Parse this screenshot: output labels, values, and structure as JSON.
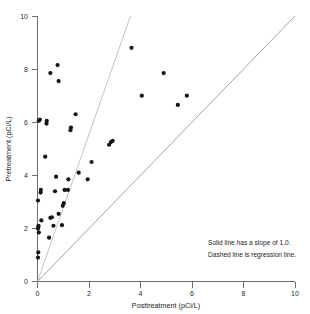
{
  "chart_data": {
    "type": "scatter",
    "title": "",
    "xlabel": "Posttreatment (pCi/L)",
    "ylabel": "Pretreatment (pCi/L)",
    "xlim": [
      0,
      10
    ],
    "ylim": [
      0,
      10
    ],
    "xticks": [
      0,
      2,
      4,
      6,
      8,
      10
    ],
    "yticks": [
      0,
      2,
      4,
      6,
      8,
      10
    ],
    "xticklabels": [
      "0",
      "2",
      "4",
      "6",
      "8",
      "10"
    ],
    "yticklabels": [
      "0",
      "2",
      "4",
      "6",
      "8",
      "10"
    ],
    "grid": false,
    "legend": "none",
    "points": [
      [
        0.02,
        0.9
      ],
      [
        0.03,
        1.1
      ],
      [
        0.05,
        1.85
      ],
      [
        0.02,
        2.0
      ],
      [
        0.03,
        2.05
      ],
      [
        0.04,
        2.1
      ],
      [
        0.15,
        2.3
      ],
      [
        0.02,
        3.05
      ],
      [
        0.12,
        3.35
      ],
      [
        0.13,
        3.45
      ],
      [
        0.05,
        6.05
      ],
      [
        0.09,
        6.1
      ],
      [
        0.35,
        5.95
      ],
      [
        0.36,
        6.05
      ],
      [
        0.3,
        4.7
      ],
      [
        0.45,
        1.65
      ],
      [
        0.5,
        2.4
      ],
      [
        0.56,
        2.42
      ],
      [
        0.62,
        2.1
      ],
      [
        0.68,
        3.4
      ],
      [
        0.72,
        3.95
      ],
      [
        0.5,
        7.85
      ],
      [
        0.78,
        8.15
      ],
      [
        0.82,
        7.55
      ],
      [
        0.82,
        2.55
      ],
      [
        0.95,
        2.12
      ],
      [
        0.98,
        2.85
      ],
      [
        1.02,
        2.95
      ],
      [
        1.05,
        3.45
      ],
      [
        1.18,
        3.45
      ],
      [
        1.2,
        3.85
      ],
      [
        1.28,
        5.7
      ],
      [
        1.3,
        5.8
      ],
      [
        1.48,
        6.3
      ],
      [
        1.6,
        4.1
      ],
      [
        1.95,
        3.85
      ],
      [
        2.1,
        4.5
      ],
      [
        2.78,
        5.15
      ],
      [
        2.85,
        5.25
      ],
      [
        2.92,
        5.3
      ],
      [
        3.65,
        8.8
      ],
      [
        4.05,
        7.0
      ],
      [
        4.9,
        7.85
      ],
      [
        5.45,
        6.65
      ],
      [
        5.8,
        7.0
      ]
    ],
    "lines": [
      {
        "name": "solid-identity-line",
        "style": "solid",
        "slope": 1.0,
        "intercept": 0.0,
        "from": [
          0,
          0
        ],
        "to": [
          10,
          10
        ]
      },
      {
        "name": "dashed-regression-line",
        "style": "dashed",
        "slope": 2.77,
        "intercept": 0.0,
        "from": [
          0,
          0
        ],
        "to": [
          3.61,
          10
        ]
      }
    ],
    "annotations": [
      "Solid line has a slope of 1.0.",
      "Dashed line is regression line."
    ]
  },
  "notes": {
    "line1": "Solid line has a slope of 1.0.",
    "line2": "Dashed line is regression line."
  },
  "axes": {
    "x_title": "Posttreatment (pCi/L)",
    "y_title": "Pretreatment (pCi/L)"
  }
}
